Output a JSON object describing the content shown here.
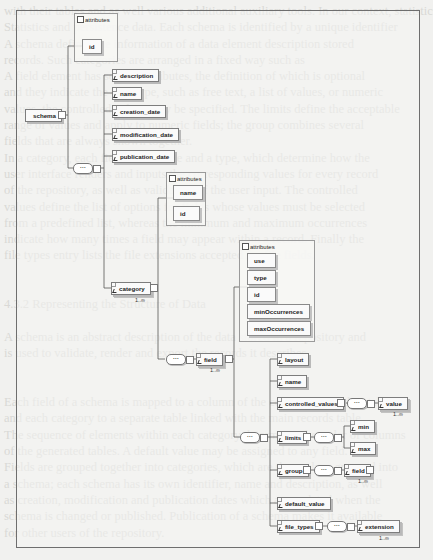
{
  "page": {
    "background_bleed_lines": [
      "with their tables and as well various additional auxiliary tools. In our context, statistics",
      "Statistics and persistence data. Each schema is identified by a unique identifier",
      "A schema defines the information of a data element description stored",
      "records. Such categories are arranged in a fixed way such as",
      "A field element has several attributes, the definition of which is optional",
      "and they indicate the data type, such as free text, a list of values, or numeric",
      "values, the controlled values may be specified. The limits define the acceptable",
      "range of values and apply to numeric fields; the group combines several",
      "fields that are always shown together.",
      "In a category, each field has a name and a type, which determine how the",
      "user interface renders and inputs the corresponding values for every record",
      "of the repository, as well as validation of the user input. The controlled",
      "values define the list of options for fields whose values must be selected",
      "from a predefined list, whereas the minimum and maximum occurrences",
      "indicate how many times a field may appear within a record. Finally the",
      "file types entry lists the file extensions accepted for file fields.",
      "",
      "",
      "4.3.2 Representing the Structure of Data",
      "",
      "A schema is an abstract description of the data stored in a repository and",
      "is used to validate, render and export the records it describes.",
      "",
      "",
      "Each field of a schema is mapped to a column of the corresponding data table,",
      "and each category to a separate table linked with the main records table.",
      "The sequence of elements within each category determines the order of columns",
      "of the generated tables. A default value may be assigned to any field.",
      "Fields are grouped together into categories, which are themselves grouped into",
      "a schema; each schema has its own identifier, name and description, as well",
      "as creation, modification and publication dates which are updated when the",
      "schema is changed or published. Publication of a schema makes it available",
      "for other users of the repository.",
      "",
      "",
      ""
    ]
  },
  "diagram": {
    "frame_color": "#6e6e6e",
    "root": {
      "name": "schema",
      "attributes_label": "attributes",
      "attributes": [
        "id"
      ],
      "children": [
        "description",
        "name",
        "creation_date",
        "modification_date",
        "publication_date"
      ],
      "sequence_label": "···"
    },
    "category": {
      "name": "category",
      "cardinality": "1..∞",
      "attributes_label": "attributes",
      "attributes": [
        "name",
        "id"
      ],
      "sequence_label": "···"
    },
    "field": {
      "name": "field",
      "cardinality": "1..∞",
      "attributes_label": "attributes",
      "attributes": [
        "use",
        "type",
        "id",
        "minOccurrences",
        "maxOccurrences"
      ],
      "sequence_label": "···",
      "children": {
        "layout": "layout",
        "name": "name",
        "controlled_values": "controlled_values",
        "controlled_values_child": "value",
        "controlled_values_child_cardinality": "1..∞",
        "limits": "limits",
        "limits_children": [
          "min",
          "max"
        ],
        "group": "group",
        "group_child": "field",
        "group_child_cardinality": "1..∞",
        "default_value": "default_value",
        "file_types": "file_types",
        "file_types_child": "extension",
        "file_types_child_cardinality": "1..∞"
      }
    }
  }
}
